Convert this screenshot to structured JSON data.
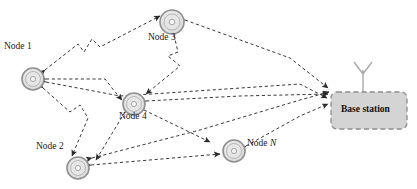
{
  "figure": {
    "type": "network-topology-diagram",
    "background": "#ffffff",
    "link_style": "dashed",
    "arrow_color": "#2b2b2b"
  },
  "colors": {
    "node_ring_outer": "#9a9a9a",
    "node_ring_inner": "#c9c9c9",
    "node_fill": "#e2e2e2",
    "base_station_fill": "#d4d4d4",
    "base_station_border": "#8c8c8c",
    "link": "#3a3a3a",
    "text": "#1a1a1a"
  },
  "nodes": [
    {
      "id": "node1",
      "label": "Node 1",
      "italic_suffix": "",
      "cx": 33,
      "cy": 79,
      "r": 11,
      "label_x": 4,
      "label_y": 48
    },
    {
      "id": "node2",
      "label": "Node 2",
      "italic_suffix": "",
      "cx": 78,
      "cy": 168,
      "r": 11,
      "label_x": 36,
      "label_y": 148
    },
    {
      "id": "node3",
      "label": "Node 3",
      "italic_suffix": "",
      "cx": 172,
      "cy": 22,
      "r": 12,
      "label_x": 148,
      "label_y": 39
    },
    {
      "id": "node4",
      "label": "Node 4",
      "italic_suffix": "",
      "cx": 134,
      "cy": 104,
      "r": 11,
      "label_x": 119,
      "label_y": 118
    },
    {
      "id": "nodeN",
      "label": "Node ",
      "italic_suffix": "N",
      "cx": 234,
      "cy": 151,
      "r": 11,
      "label_x": 247,
      "label_y": 145
    }
  ],
  "base_station": {
    "label": "Base station",
    "x": 331,
    "y": 92,
    "width": 76,
    "height": 37,
    "corner_radius": 6,
    "label_x": 341,
    "label_y": 105,
    "antenna": {
      "x": 363,
      "top": 64,
      "bottom": 92,
      "spread": 9
    }
  },
  "links": [
    {
      "from": "node1",
      "to": "node3",
      "style": "dashed",
      "arrows": "both"
    },
    {
      "from": "node1",
      "to": "node4",
      "style": "dashed",
      "arrows": "both"
    },
    {
      "from": "node1",
      "to": "node2",
      "style": "dashed",
      "arrows": "both"
    },
    {
      "from": "node1",
      "to": "base_station",
      "style": "dashed",
      "arrows": "both"
    },
    {
      "from": "node3",
      "to": "node4",
      "style": "dashed",
      "arrows": "both"
    },
    {
      "from": "node3",
      "to": "base_station",
      "style": "dashed",
      "arrows": "both"
    },
    {
      "from": "node4",
      "to": "node2",
      "style": "dashed",
      "arrows": "both"
    },
    {
      "from": "node4",
      "to": "nodeN",
      "style": "dashed",
      "arrows": "both"
    },
    {
      "from": "node4",
      "to": "base_station",
      "style": "dashed",
      "arrows": "both"
    },
    {
      "from": "node2",
      "to": "nodeN",
      "style": "dashed",
      "arrows": "both"
    },
    {
      "from": "nodeN",
      "to": "base_station",
      "style": "dashed",
      "arrows": "both"
    },
    {
      "from": "node2",
      "to": "base_station",
      "style": "dashed",
      "arrows": "both"
    }
  ]
}
